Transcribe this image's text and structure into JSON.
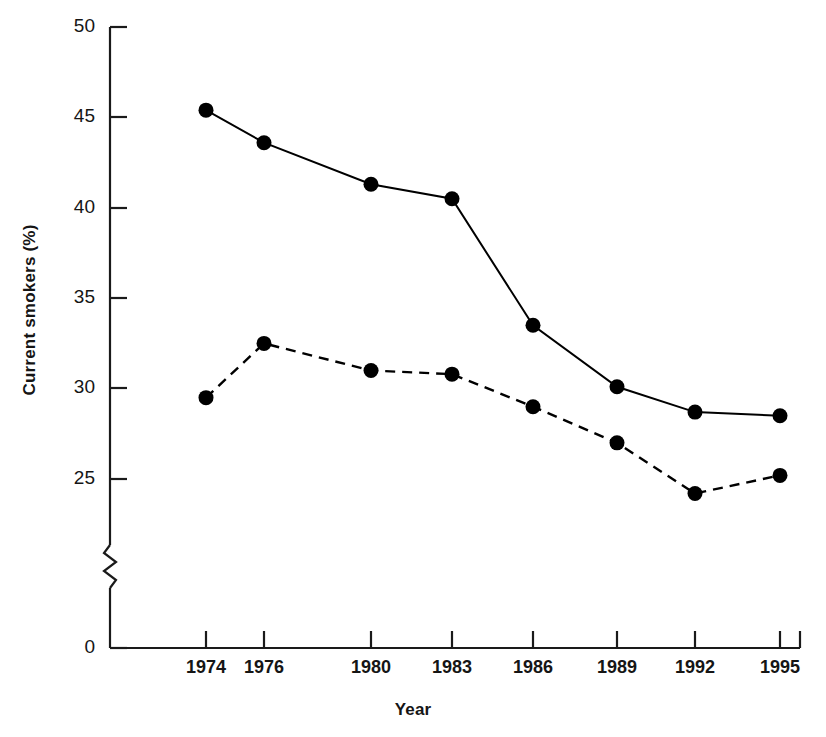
{
  "chart_data": {
    "type": "line",
    "title": "",
    "subtitle": "",
    "xlabel": "Year",
    "ylabel": "Current smokers (%)",
    "categories": [
      "1974",
      "1976",
      "1980",
      "1983",
      "1986",
      "1989",
      "1992",
      "1995"
    ],
    "x": [
      1974,
      1976,
      1980,
      1983,
      1986,
      1989,
      1992,
      1995
    ],
    "series": [
      {
        "name": "solid-series",
        "style": "solid",
        "marker": "filled-circle",
        "color": "#000000",
        "values": [
          45.4,
          43.6,
          41.3,
          40.5,
          33.5,
          30.1,
          28.7,
          28.5
        ]
      },
      {
        "name": "dashed-series",
        "style": "dashed",
        "marker": "filled-circle",
        "color": "#000000",
        "values": [
          29.5,
          32.5,
          31.0,
          30.8,
          29.0,
          27.0,
          24.2,
          25.2
        ]
      }
    ],
    "ylim": [
      25,
      50
    ],
    "yticks": [
      "0",
      "25",
      "30",
      "35",
      "40",
      "45",
      "50"
    ],
    "ytick_values": [
      0,
      25,
      30,
      35,
      40,
      45,
      50
    ],
    "xticks": [
      "1974",
      "1976",
      "1980",
      "1983",
      "1986",
      "1989",
      "1992",
      "1995"
    ],
    "axis_break": {
      "present": true,
      "between": [
        0,
        25
      ],
      "symbol": "zigzag"
    },
    "grid": false,
    "legend": "none",
    "background": "#ffffff",
    "axis_color": "#1a1a1a"
  },
  "axes": {
    "y_label": "Current smokers (%)",
    "x_label": "Year"
  },
  "y_ticks": [
    {
      "label": "50",
      "y": 27
    },
    {
      "label": "45",
      "y": 117
    },
    {
      "label": "40",
      "y": 208
    },
    {
      "label": "35",
      "y": 298
    },
    {
      "label": "30",
      "y": 388
    },
    {
      "label": "25",
      "y": 479
    },
    {
      "label": "0",
      "y": 648
    }
  ],
  "x_ticks": [
    {
      "label": "1974",
      "x": 206
    },
    {
      "label": "1976",
      "x": 264
    },
    {
      "label": "1980",
      "x": 371
    },
    {
      "label": "1983",
      "x": 452
    },
    {
      "label": "1986",
      "x": 533
    },
    {
      "label": "1989",
      "x": 617
    },
    {
      "label": "1992",
      "x": 695
    },
    {
      "label": "1995",
      "x": 780
    }
  ]
}
